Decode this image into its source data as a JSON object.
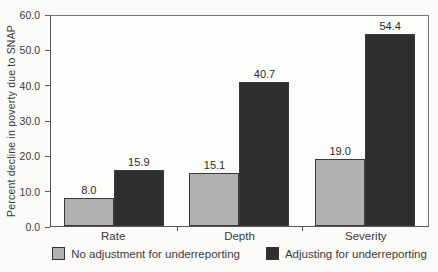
{
  "chart_data": {
    "type": "bar",
    "title": "",
    "categories": [
      "Rate",
      "Depth",
      "Severity"
    ],
    "series": [
      {
        "name": "No adjustment for underreporting",
        "values": [
          8.0,
          15.1,
          19.0
        ],
        "value_labels": [
          "8.0",
          "15.1",
          "19.0"
        ],
        "color": "#b1b1b1"
      },
      {
        "name": "Adjusting for underreporting",
        "values": [
          15.9,
          40.7,
          54.4
        ],
        "value_labels": [
          "15.9",
          "40.7",
          "54.4"
        ],
        "color": "#2e2e2e"
      }
    ],
    "xlabel": "",
    "ylabel": "Percent decline in poverty due to SNAP",
    "ylim": [
      0,
      60
    ],
    "ytick_step": 10,
    "ytick_labels": [
      "0.0",
      "10.0",
      "20.0",
      "30.0",
      "40.0",
      "50.0",
      "60.0"
    ],
    "grid": false,
    "legend_position": "bottom",
    "value_labels_shown": true
  },
  "colors": {
    "background": "#fbfbf9",
    "plot_background": "#fdfdfc",
    "axis": "#555555",
    "bar_border": "#3a3a3a",
    "text": "#3a3a3a",
    "series_light": "#b1b1b1",
    "series_dark": "#2e2e2e"
  }
}
